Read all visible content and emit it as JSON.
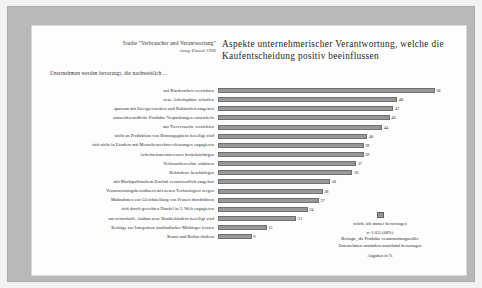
{
  "header": {
    "study_label": "Studie \"Verbraucher und Verantwortung\"",
    "study_source": "imug-Emnid 1996",
    "title": "Aspekte unternehmerischer Verantwortung, welche die Kaufentscheidung positiv beeinflussen",
    "subhead": "Unternehmen werden bevorzugt, die nachweislich ..."
  },
  "legend": {
    "swatch_label": "würde ich immer bevorzugen",
    "sample": "n=1.055 (68%)",
    "description_line1": "Befragte, die Produkte verantwortungsvoller",
    "description_line2": "Unternehmen zumindest manchmal bevorzugen",
    "unit": "Angaben in %"
  },
  "chart_data": {
    "type": "bar",
    "orientation": "horizontal",
    "title": "Aspekte unternehmerischer Verantwortung, welche die Kaufentscheidung positiv beeinflussen",
    "xlabel": "",
    "ylabel": "",
    "xlim": [
      0,
      60
    ],
    "grid": false,
    "legend_position": "bottom-right",
    "unit": "%",
    "categories": [
      "auf Kinderarbeit verzichten",
      "neue Arbeitsplätze schaffen",
      "sparsam mit Energievorräten und Rohstoffen umgehen",
      "umweltfreundliche Produkte/Verpackungen entwickeln",
      "auf Tierversuche verzichten",
      "nicht an Produktion von Rüstungsgütern beteiligt sind",
      "sich nicht in Ländern mit Menschenrechtsverletzungen engagieren",
      "Arbeitnehmerinteressen berücksichtigen",
      "Verbraucherrechte schützen",
      "Behinderte beschäftigen",
      "mit Marktpolitischem Einfluß verantwortlich umgehen",
      "Verantwortungsbewußtsein mit neuen Technologien zeigen",
      "Maßnahmen zur Gleichstellung von Frauen durchführen",
      "sich durch gerechten Handel in 3. Welt engagieren",
      "am wirtschaftl. Aufbau neue Bundesländern beteiligt sind",
      "Beiträge zur Integration ausländischer Mitbürger leisten",
      "Kunst und Kultur fördern"
    ],
    "values": [
      58,
      48,
      47,
      46,
      44,
      40,
      39,
      39,
      37,
      36,
      30,
      28,
      27,
      24,
      21,
      13,
      9
    ]
  }
}
